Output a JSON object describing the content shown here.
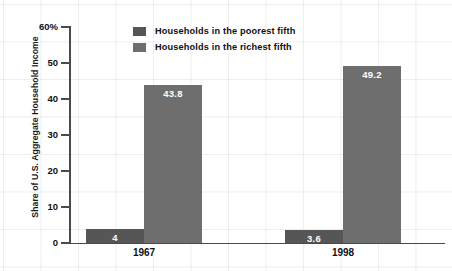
{
  "chart_data": {
    "type": "bar",
    "title": "",
    "xlabel": "",
    "ylabel": "Share of U.S. Aggregate Household Income",
    "categories": [
      "1967",
      "1998"
    ],
    "ylim": [
      0,
      60
    ],
    "ytick_values": [
      0,
      10,
      20,
      30,
      40,
      50,
      60
    ],
    "ytick_labels": [
      "0",
      "10",
      "20",
      "30",
      "40",
      "50",
      "60%"
    ],
    "grid": true,
    "legend_position": "top-center",
    "series": [
      {
        "name": "Households in the poorest fifth",
        "color": "#565656",
        "values": [
          4,
          3.6
        ],
        "value_labels": [
          "4",
          "3.6"
        ]
      },
      {
        "name": "Households in the richest fifth",
        "color": "#6e6e6e",
        "values": [
          43.8,
          49.2
        ],
        "value_labels": [
          "43.8",
          "49.2"
        ]
      }
    ]
  },
  "axis": {
    "y_title": "Share of U.S. Aggregate Household Income"
  },
  "legend": {
    "items": [
      {
        "label": "Households in the poorest fifth",
        "color": "#565656"
      },
      {
        "label": "Households in the richest fifth",
        "color": "#6e6e6e"
      }
    ]
  },
  "colors": {
    "poorest": "#565656",
    "richest": "#6e6e6e",
    "axis": "#4a4a4a",
    "text": "#111111",
    "grid": "#aaaab9",
    "background": "#ffffff"
  }
}
